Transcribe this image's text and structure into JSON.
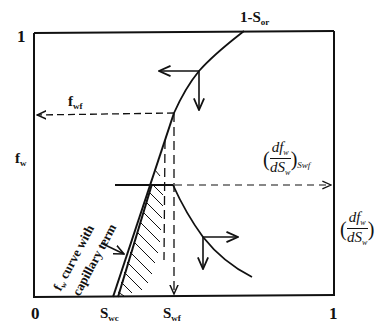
{
  "diagram": {
    "type": "fractional-flow-derivative-diagram",
    "axes": {
      "x_origin_label": "0",
      "x_end_label": "1",
      "y_top_label": "1",
      "y_axis_label_main": "f",
      "y_axis_label_sub": "w",
      "right_axis_label": {
        "num": "df",
        "num_sub": "w",
        "den": "dS",
        "den_sub": "w"
      }
    },
    "x_markers": {
      "swc": {
        "main": "S",
        "sub": "wc"
      },
      "swf": {
        "main": "S",
        "sub": "wf"
      }
    },
    "annotations": {
      "one_minus_sor": {
        "main": "1-S",
        "sub": "or"
      },
      "fwf": {
        "main": "f",
        "sub": "wf"
      },
      "derivative_at_swf": {
        "num": "df",
        "num_sub": "w",
        "den": "dS",
        "den_sub": "w",
        "outer_sub": "Swf"
      },
      "capillary_note_line1": "f",
      "capillary_note_line1_sub": "w",
      "capillary_note_line1_rest": " curve with",
      "capillary_note_line2": "capillary term"
    }
  }
}
